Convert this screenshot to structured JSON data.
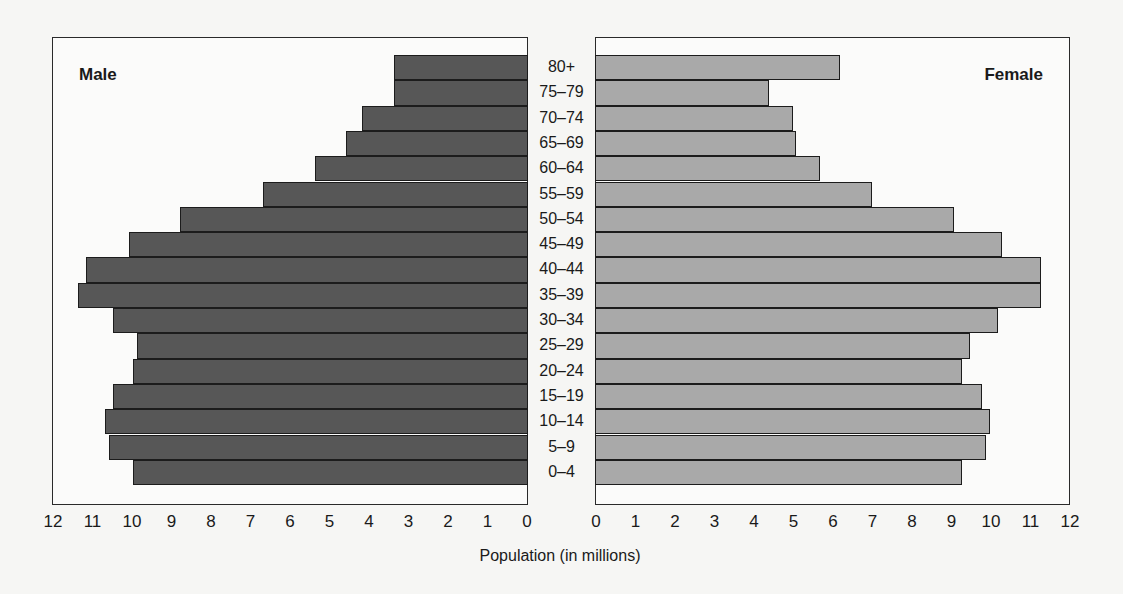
{
  "chart_data": {
    "type": "bar",
    "subtype": "population-pyramid",
    "title": "",
    "xlabel": "Population (in millions)",
    "ylabel": "",
    "xlim": [
      0,
      12
    ],
    "x_ticks_male": [
      "12",
      "11",
      "10",
      "9",
      "8",
      "7",
      "6",
      "5",
      "4",
      "3",
      "2",
      "1",
      "0"
    ],
    "x_ticks_female": [
      "0",
      "1",
      "2",
      "3",
      "4",
      "5",
      "6",
      "7",
      "8",
      "9",
      "10",
      "11",
      "12"
    ],
    "categories": [
      "80+",
      "75–79",
      "70–74",
      "65–69",
      "60–64",
      "55–59",
      "50–54",
      "45–49",
      "40–44",
      "35–39",
      "30–34",
      "25–29",
      "20–24",
      "15–19",
      "10–14",
      "5–9",
      "0–4"
    ],
    "series": [
      {
        "name": "Male",
        "color": "#575757",
        "values": [
          3.4,
          3.4,
          4.2,
          4.6,
          5.4,
          6.7,
          8.8,
          10.1,
          11.2,
          11.4,
          10.5,
          9.9,
          10.0,
          10.5,
          10.7,
          10.6,
          10.0
        ]
      },
      {
        "name": "Female",
        "color": "#a9a9a9",
        "values": [
          6.2,
          4.4,
          5.0,
          5.1,
          5.7,
          7.0,
          9.1,
          10.3,
          11.3,
          11.3,
          10.2,
          9.5,
          9.3,
          9.8,
          10.0,
          9.9,
          9.3
        ]
      }
    ],
    "grid": false,
    "legend": "panel titles 'Male' (top-left) and 'Female' (top-right)"
  },
  "panels": {
    "male_title": "Male",
    "female_title": "Female"
  }
}
